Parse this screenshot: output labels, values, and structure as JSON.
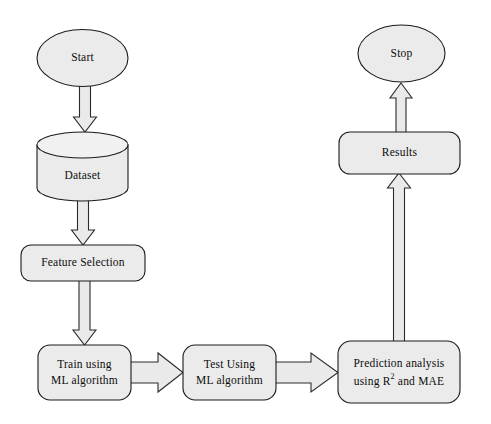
{
  "diagram": {
    "background_color": "#ffffff",
    "node_fill_color": "#ebebeb",
    "node_stroke_color": "#1a1a1a",
    "arrow_fill_color": "#eaeaea",
    "arrow_stroke_color": "#2b2b2b",
    "text_color": "#0d0d0d"
  },
  "nodes": {
    "start": {
      "label": "Start",
      "shape": "ellipse"
    },
    "dataset": {
      "label": "Dataset",
      "shape": "cylinder"
    },
    "feature_selection": {
      "label": "Feature Selection",
      "shape": "rounded-rect"
    },
    "train": {
      "label_line1": "Train using",
      "label_line2": "ML algorithm",
      "shape": "rounded-rect"
    },
    "test": {
      "label_line1": "Test Using",
      "label_line2": "ML algorithm",
      "shape": "rounded-rect"
    },
    "prediction": {
      "label_line1": "Prediction analysis",
      "label_line2_part1": "using R",
      "label_line2_sup": "2",
      "label_line2_part2": " and MAE",
      "shape": "rounded-rect"
    },
    "results": {
      "label": "Results",
      "shape": "rounded-rect"
    },
    "stop": {
      "label": "Stop",
      "shape": "ellipse"
    }
  },
  "edges": [
    {
      "from": "start",
      "to": "dataset",
      "direction": "down"
    },
    {
      "from": "dataset",
      "to": "feature_selection",
      "direction": "down"
    },
    {
      "from": "feature_selection",
      "to": "train",
      "direction": "down"
    },
    {
      "from": "train",
      "to": "test",
      "direction": "right"
    },
    {
      "from": "test",
      "to": "prediction",
      "direction": "right"
    },
    {
      "from": "prediction",
      "to": "results",
      "direction": "up"
    },
    {
      "from": "results",
      "to": "stop",
      "direction": "up"
    }
  ]
}
